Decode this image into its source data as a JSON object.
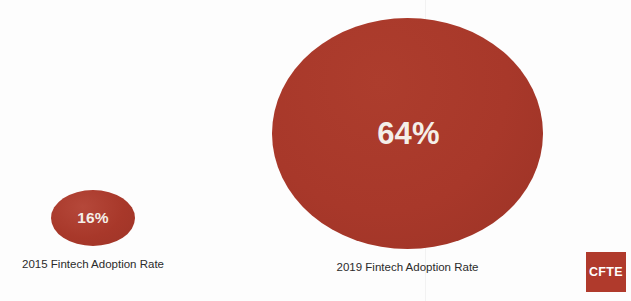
{
  "chart_data": {
    "type": "bubble",
    "title": "",
    "subtitle": "",
    "xlabel": "",
    "ylabel": "",
    "categories": [
      "2015 Fintech Adoption Rate",
      "2019 Fintech Adoption Rate"
    ],
    "values": [
      16,
      64
    ],
    "unit": "%",
    "grid": false,
    "legend": "none",
    "series": [
      {
        "name": "Fintech Adoption Rate",
        "points": [
          {
            "label": "2015 Fintech Adoption Rate",
            "value": 16,
            "value_text": "16%"
          },
          {
            "label": "2019 Fintech Adoption Rate",
            "value": 64,
            "value_text": "64%"
          }
        ]
      }
    ]
  },
  "bubbles": {
    "b2015": {
      "value_text": "16%",
      "label": "2015 Fintech Adoption Rate"
    },
    "b2019": {
      "value_text": "64%",
      "label": "2019 Fintech Adoption Rate"
    }
  },
  "logo": {
    "text": "CFTE"
  },
  "colors": {
    "bubble_red": "#a8382a",
    "logo_red": "#b03a2c",
    "value_text": "#f4efe9",
    "label_text": "#2b2b2b",
    "background": "#fdfdfd"
  }
}
